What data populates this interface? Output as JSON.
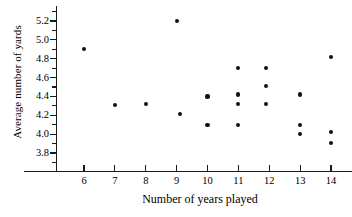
{
  "chart_data": {
    "type": "scatter",
    "title": "",
    "xlabel": "Number of years played",
    "ylabel": "Average number of yards",
    "xlim": [
      5.2,
      14.7
    ],
    "ylim": [
      3.69,
      5.31
    ],
    "grid": false,
    "legend": null,
    "xticks": [
      6,
      7,
      8,
      9,
      10,
      11,
      12,
      13,
      14
    ],
    "xtick_labels": [
      "6",
      "7",
      "8",
      "9",
      "10",
      "11",
      "12",
      "13",
      "14"
    ],
    "yticks": [
      3.8,
      4.0,
      4.2,
      4.4,
      4.6,
      4.8,
      5.0,
      5.2
    ],
    "ytick_labels": [
      "3.8",
      "4.0",
      "4.2",
      "4.4",
      "4.6",
      "4.8",
      "5.0",
      "5.2"
    ],
    "y_minor_ticks": [
      3.7,
      3.9,
      4.1,
      4.3,
      4.5,
      4.7,
      4.9,
      5.1,
      5.3
    ],
    "marker": "filled-circle",
    "marker_color": "#111111",
    "n_points": 20,
    "x": [
      6,
      7,
      8,
      9,
      9.1,
      10,
      10,
      11,
      11,
      11,
      11,
      11.9,
      11.9,
      11.9,
      13,
      13,
      13,
      14,
      14,
      14
    ],
    "y": [
      4.9,
      4.31,
      4.32,
      5.2,
      4.21,
      4.4,
      4.1,
      4.7,
      4.42,
      4.32,
      4.1,
      4.7,
      4.51,
      4.32,
      4.42,
      4.1,
      4.0,
      4.82,
      4.02,
      3.91
    ],
    "points": [
      {
        "x": 6,
        "y": 4.9
      },
      {
        "x": 7,
        "y": 4.31
      },
      {
        "x": 8,
        "y": 4.32
      },
      {
        "x": 9,
        "y": 5.2
      },
      {
        "x": 9.1,
        "y": 4.21
      },
      {
        "x": 10,
        "y": 4.4
      },
      {
        "x": 10,
        "y": 4.1
      },
      {
        "x": 11,
        "y": 4.7
      },
      {
        "x": 11,
        "y": 4.42
      },
      {
        "x": 11,
        "y": 4.32
      },
      {
        "x": 11,
        "y": 4.1
      },
      {
        "x": 11.9,
        "y": 4.7
      },
      {
        "x": 11.9,
        "y": 4.51
      },
      {
        "x": 11.9,
        "y": 4.32
      },
      {
        "x": 13,
        "y": 4.42
      },
      {
        "x": 13,
        "y": 4.1
      },
      {
        "x": 13,
        "y": 4.0
      },
      {
        "x": 14,
        "y": 4.82
      },
      {
        "x": 14,
        "y": 4.02
      },
      {
        "x": 14,
        "y": 3.91
      }
    ]
  }
}
